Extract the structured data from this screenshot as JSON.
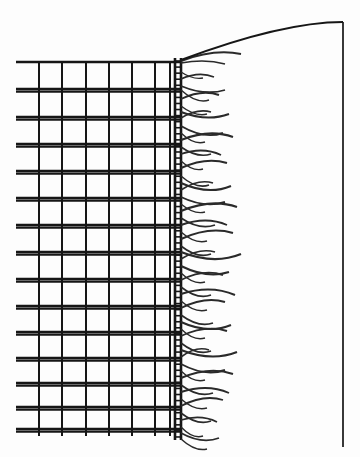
{
  "figure": {
    "kind": "line-engraving",
    "alt_text": "Black and white line drawing of a rectangular woven mesh grid whose right-hand edge terminates in a dense selvedge band from which loose fringe threads curve outward to the right; a long sweeping curve rises from the top of the selvedge to a vertical line at the far right.",
    "canvas": {
      "width": 360,
      "height": 457
    },
    "colors": {
      "background": "#fdfdfd",
      "ink": "#161616",
      "ink_light": "#2a2a2a"
    }
  },
  "geometry": {
    "mesh": {
      "weft_left_x": 16,
      "weft_right_x": 180,
      "weft_pair_gap": 2.6,
      "weft_y": [
        62,
        89,
        117,
        144,
        171,
        198,
        225,
        252,
        279,
        306,
        332,
        358,
        383,
        407,
        429
      ],
      "weft_stroke": 2.4,
      "warp_top_y": 62,
      "warp_bottom_y": 436,
      "warp_x": [
        39,
        62,
        86,
        109,
        132,
        155,
        170
      ],
      "warp_stroke": 2.0
    },
    "selvedge": {
      "left_rail_x": 175,
      "right_rail_x": 181,
      "top_y": 58,
      "bottom_y": 440,
      "rail_stroke": 2.6,
      "rung_count": 63,
      "rung_stroke": 1.6
    },
    "sweep": {
      "start": [
        181,
        60
      ],
      "control_1": [
        245,
        36
      ],
      "control_2": [
        300,
        22
      ],
      "end": [
        343,
        22
      ],
      "stroke": 1.9
    },
    "edge_vertical": {
      "x": 343,
      "top_y": 22,
      "bottom_y": 447,
      "stroke": 1.7
    },
    "fringe": {
      "origin_x": 181,
      "stroke_min": 1.2,
      "stroke_max": 2.3,
      "threads": [
        {
          "y": 61,
          "dx": 60,
          "dy": -7,
          "bow": -9,
          "w": 2.0
        },
        {
          "y": 63,
          "dx": 44,
          "dy": 1,
          "bow": -5,
          "w": 1.6
        },
        {
          "y": 72,
          "dx": 22,
          "dy": 6,
          "bow": 5,
          "w": 1.4
        },
        {
          "y": 79,
          "dx": 33,
          "dy": -2,
          "bow": -7,
          "w": 1.7
        },
        {
          "y": 86,
          "dx": 44,
          "dy": 4,
          "bow": 8,
          "w": 1.8
        },
        {
          "y": 90,
          "dx": 28,
          "dy": 10,
          "bow": 9,
          "w": 1.5
        },
        {
          "y": 99,
          "dx": 38,
          "dy": -4,
          "bow": -8,
          "w": 1.9
        },
        {
          "y": 106,
          "dx": 26,
          "dy": 8,
          "bow": 7,
          "w": 1.5
        },
        {
          "y": 112,
          "dx": 48,
          "dy": 2,
          "bow": 9,
          "w": 2.0
        },
        {
          "y": 118,
          "dx": 30,
          "dy": -6,
          "bow": -7,
          "w": 1.6
        },
        {
          "y": 126,
          "dx": 42,
          "dy": 7,
          "bow": 10,
          "w": 1.9
        },
        {
          "y": 133,
          "dx": 24,
          "dy": 9,
          "bow": 8,
          "w": 1.4
        },
        {
          "y": 140,
          "dx": 52,
          "dy": -3,
          "bow": -10,
          "w": 2.1
        },
        {
          "y": 147,
          "dx": 30,
          "dy": 7,
          "bow": 8,
          "w": 1.6
        },
        {
          "y": 154,
          "dx": 40,
          "dy": 1,
          "bow": -8,
          "w": 1.8
        },
        {
          "y": 161,
          "dx": 22,
          "dy": 8,
          "bow": 7,
          "w": 1.4
        },
        {
          "y": 168,
          "dx": 46,
          "dy": -5,
          "bow": -9,
          "w": 2.0
        },
        {
          "y": 176,
          "dx": 28,
          "dy": 9,
          "bow": 9,
          "w": 1.5
        },
        {
          "y": 183,
          "dx": 50,
          "dy": 3,
          "bow": 11,
          "w": 2.0
        },
        {
          "y": 190,
          "dx": 32,
          "dy": -7,
          "bow": -8,
          "w": 1.7
        },
        {
          "y": 197,
          "dx": 44,
          "dy": 5,
          "bow": 9,
          "w": 1.9
        },
        {
          "y": 204,
          "dx": 24,
          "dy": 8,
          "bow": 7,
          "w": 1.4
        },
        {
          "y": 211,
          "dx": 56,
          "dy": -4,
          "bow": -11,
          "w": 2.2
        },
        {
          "y": 218,
          "dx": 34,
          "dy": 7,
          "bow": 9,
          "w": 1.7
        },
        {
          "y": 225,
          "dx": 46,
          "dy": 0,
          "bow": -9,
          "w": 1.9
        },
        {
          "y": 232,
          "dx": 26,
          "dy": 9,
          "bow": 8,
          "w": 1.5
        },
        {
          "y": 239,
          "dx": 52,
          "dy": -6,
          "bow": -10,
          "w": 2.1
        },
        {
          "y": 246,
          "dx": 30,
          "dy": 8,
          "bow": 9,
          "w": 1.6
        },
        {
          "y": 252,
          "dx": 60,
          "dy": 2,
          "bow": 12,
          "w": 2.3
        },
        {
          "y": 259,
          "dx": 34,
          "dy": -7,
          "bow": -8,
          "w": 1.7
        },
        {
          "y": 266,
          "dx": 48,
          "dy": 6,
          "bow": 10,
          "w": 2.0
        },
        {
          "y": 273,
          "dx": 24,
          "dy": 9,
          "bow": 8,
          "w": 1.4
        },
        {
          "y": 280,
          "dx": 42,
          "dy": -5,
          "bow": -9,
          "w": 1.9
        },
        {
          "y": 287,
          "dx": 30,
          "dy": 8,
          "bow": 9,
          "w": 1.6
        },
        {
          "y": 294,
          "dx": 54,
          "dy": 1,
          "bow": -10,
          "w": 2.1
        },
        {
          "y": 301,
          "dx": 26,
          "dy": 9,
          "bow": 8,
          "w": 1.5
        },
        {
          "y": 308,
          "dx": 44,
          "dy": -6,
          "bow": -9,
          "w": 1.9
        },
        {
          "y": 315,
          "dx": 32,
          "dy": 8,
          "bow": 9,
          "w": 1.7
        },
        {
          "y": 322,
          "dx": 50,
          "dy": 3,
          "bow": 11,
          "w": 2.0
        },
        {
          "y": 329,
          "dx": 24,
          "dy": 9,
          "bow": 8,
          "w": 1.4
        },
        {
          "y": 336,
          "dx": 46,
          "dy": -5,
          "bow": -9,
          "w": 1.9
        },
        {
          "y": 343,
          "dx": 30,
          "dy": 8,
          "bow": 9,
          "w": 1.6
        },
        {
          "y": 350,
          "dx": 56,
          "dy": 2,
          "bow": 11,
          "w": 2.1
        },
        {
          "y": 357,
          "dx": 28,
          "dy": -7,
          "bow": -8,
          "w": 1.6
        },
        {
          "y": 364,
          "dx": 44,
          "dy": 6,
          "bow": 10,
          "w": 1.9
        },
        {
          "y": 371,
          "dx": 24,
          "dy": 9,
          "bow": 8,
          "w": 1.4
        },
        {
          "y": 378,
          "dx": 52,
          "dy": -4,
          "bow": -10,
          "w": 2.0
        },
        {
          "y": 385,
          "dx": 32,
          "dy": 8,
          "bow": 9,
          "w": 1.7
        },
        {
          "y": 392,
          "dx": 48,
          "dy": 1,
          "bow": -9,
          "w": 1.9
        },
        {
          "y": 399,
          "dx": 26,
          "dy": 9,
          "bow": 8,
          "w": 1.5
        },
        {
          "y": 406,
          "dx": 42,
          "dy": -6,
          "bow": -9,
          "w": 1.8
        },
        {
          "y": 413,
          "dx": 30,
          "dy": 8,
          "bow": 9,
          "w": 1.6
        },
        {
          "y": 420,
          "dx": 36,
          "dy": 2,
          "bow": -7,
          "w": 1.7
        },
        {
          "y": 427,
          "dx": 22,
          "dy": 9,
          "bow": 8,
          "w": 1.4
        },
        {
          "y": 433,
          "dx": 38,
          "dy": 5,
          "bow": 9,
          "w": 1.8
        },
        {
          "y": 439,
          "dx": 26,
          "dy": 10,
          "bow": 8,
          "w": 1.5
        }
      ]
    }
  }
}
